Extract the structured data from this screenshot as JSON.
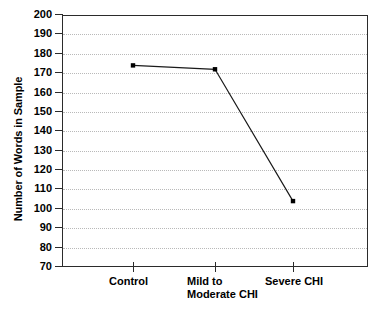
{
  "chart_data": {
    "type": "line",
    "title": "",
    "subtitle": "",
    "xlabel": "",
    "ylabel": "Number of Words in Sample",
    "categories": [
      "Control",
      "Mild to\nModerate CHI",
      "Severe CHI"
    ],
    "category_labels_flat": [
      "Control",
      "Mild to Moderate CHI",
      "Severe CHI"
    ],
    "series": [
      {
        "name": "Number of Words in Sample",
        "values": [
          174,
          172,
          104
        ]
      }
    ],
    "ylim": [
      70,
      200
    ],
    "ytick_step": 10,
    "yticks": [
      200,
      190,
      180,
      170,
      160,
      150,
      140,
      130,
      120,
      110,
      100,
      90,
      80,
      70
    ],
    "ytick_labels": [
      "200",
      "190",
      "180",
      "170",
      "160",
      "150",
      "140",
      "130",
      "120",
      "110",
      "100",
      "90",
      "80",
      "70"
    ],
    "grid": "horizontal-dotted",
    "grid_color": "#b9b9b9",
    "legend": "none",
    "legend_position": "none",
    "line_color": "#1a1a1a",
    "marker": "square",
    "marker_color": "#000000",
    "frame_color": "#2b2b2b",
    "background_color": "#ffffff",
    "annotations": []
  }
}
